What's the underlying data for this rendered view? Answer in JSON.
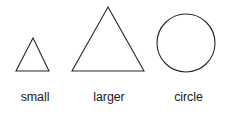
{
  "figure": {
    "background_color": "#ffffff",
    "stroke_color": "#262626",
    "text_color": "#1a1a1a",
    "width": 227,
    "height": 114
  },
  "shapes": [
    {
      "id": "small-triangle",
      "kind": "triangle",
      "points": "33,38 49,71 16,71",
      "label_lines": [
        "small",
        "triangle"
      ],
      "label_text": "small\ntriangle"
    },
    {
      "id": "larger-triangle",
      "kind": "triangle",
      "points": "108,7 144,71 72,71",
      "label_lines": [
        "larger",
        "triangle"
      ],
      "label_text": "larger\ntriangle"
    },
    {
      "id": "circle",
      "kind": "circle",
      "cx": 186,
      "cy": 43,
      "r": 29,
      "label_lines": [
        "circle"
      ],
      "label_text": "circle"
    }
  ]
}
